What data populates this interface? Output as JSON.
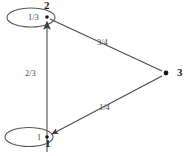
{
  "figure": {
    "type": "directed-graph",
    "title": "",
    "background_color": "#ffffff",
    "stroke_color": "#4a4a4a",
    "label_color": "#1a1a1a"
  },
  "nodes": [
    {
      "id": "1",
      "label": "1",
      "x": 47,
      "y": 137,
      "shape": "dot"
    },
    {
      "id": "2",
      "label": "2",
      "x": 47,
      "y": 17,
      "shape": "dot"
    },
    {
      "id": "3",
      "label": "3",
      "x": 166,
      "y": 73,
      "shape": "dot"
    }
  ],
  "edges": [
    {
      "from": "1",
      "to": "2",
      "weight": "2/3",
      "label_x": 26,
      "label_y": 72
    },
    {
      "from": "2",
      "to": "3",
      "weight": "3/4",
      "label_x": 98,
      "label_y": 39
    },
    {
      "from": "3",
      "to": "1",
      "weight": "1/4",
      "label_x": 100,
      "label_y": 104
    }
  ],
  "self_loops": [
    {
      "node": "2",
      "weight": "1/3",
      "label_x": 31,
      "label_y": 17
    },
    {
      "node": "1",
      "weight": "1",
      "label_x": 38,
      "label_y": 137
    }
  ]
}
